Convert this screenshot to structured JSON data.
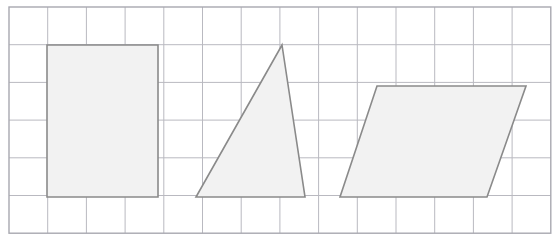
{
  "canvas": {
    "width": 560,
    "height": 237,
    "background_color": "#ffffff"
  },
  "grid": {
    "columns": 14,
    "rows": 6,
    "x_start": 9,
    "y_start": 7,
    "cell_width": 38.7,
    "cell_height": 37.7,
    "line_color": "#b9b9c0",
    "border_color": "#a8a8b0",
    "line_width": 1,
    "border_width": 1.4
  },
  "shapes": [
    {
      "id": "rectangle",
      "name": "rectangle",
      "kind": "polygon",
      "fill_color": "#f2f2f2",
      "stroke_color": "#8a8a8a",
      "stroke_width": 1.6,
      "points": "47,45 158,45 158,197 47,197",
      "grid_units": {
        "width": 3,
        "height": 4
      }
    },
    {
      "id": "triangle",
      "name": "triangle",
      "kind": "polygon",
      "fill_color": "#f2f2f2",
      "stroke_color": "#8a8a8a",
      "stroke_width": 1.6,
      "points": "282,45 305,197 196,197",
      "grid_units": {
        "base": 3,
        "height": 4
      }
    },
    {
      "id": "parallelogram",
      "name": "parallelogram",
      "kind": "polygon",
      "fill_color": "#f2f2f2",
      "stroke_color": "#8a8a8a",
      "stroke_width": 1.6,
      "points": "377,86 526,86 487,197 340,197",
      "grid_units": {
        "base": 4,
        "height": 3
      }
    }
  ]
}
